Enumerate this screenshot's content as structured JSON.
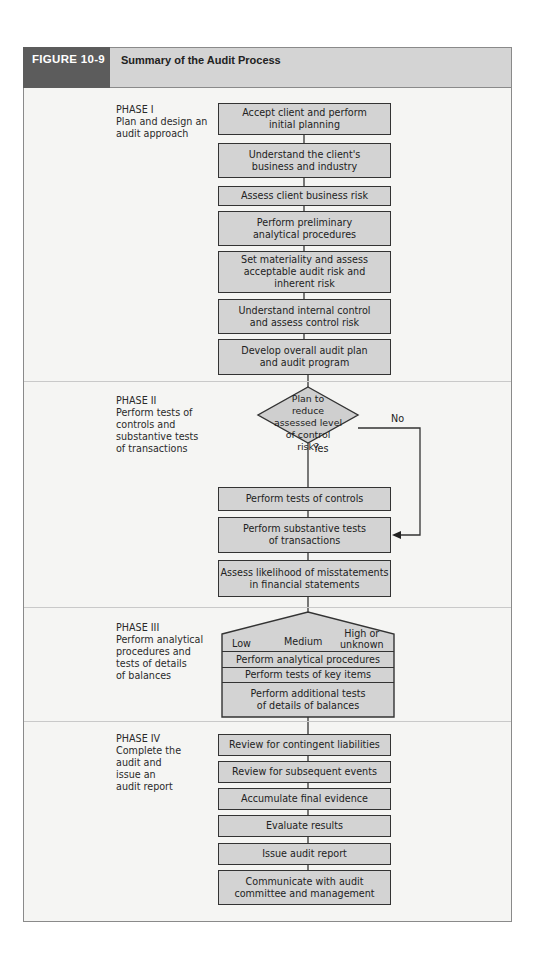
{
  "figure": {
    "number": "FIGURE 10-9",
    "title": "Summary of the Audit Process"
  },
  "colors": {
    "header_dark": "#5c5c5c",
    "header_light": "#d4d4d4",
    "box_fill": "#d3d3d3",
    "frame_bg": "#f5f5f3"
  },
  "phases": [
    {
      "label": "PHASE I\nPlan and design an\naudit approach",
      "steps": [
        "Accept client and perform\ninitial planning",
        "Understand the client's\nbusiness and industry",
        "Assess client business risk",
        "Perform preliminary\nanalytical procedures",
        "Set materiality and assess\nacceptable audit risk and\ninherent risk",
        "Understand internal control\nand assess control risk",
        "Develop overall audit plan\nand audit program"
      ]
    },
    {
      "label": "PHASE II\nPerform tests of\ncontrols and\nsubstantive tests\nof transactions",
      "decision": "Plan to\nreduce\nassessed level\nof control\nrisk?",
      "yes_label": "Yes",
      "no_label": "No",
      "steps": [
        "Perform tests of controls",
        "Perform substantive tests\nof transactions",
        "Assess likelihood of misstatements\nin financial statements"
      ]
    },
    {
      "label": "PHASE III\nPerform analytical\nprocedures and\ntests of details\nof balances",
      "levels": [
        "Low",
        "Medium",
        "High or\nunknown"
      ],
      "steps": [
        "Perform analytical procedures",
        "Perform tests of key items",
        "Perform additional tests\nof details of balances"
      ]
    },
    {
      "label": "PHASE IV\nComplete the\naudit and\nissue an\naudit report",
      "steps": [
        "Review for contingent liabilities",
        "Review for subsequent events",
        "Accumulate final evidence",
        "Evaluate results",
        "Issue audit report",
        "Communicate with audit\ncommittee and management"
      ]
    }
  ]
}
